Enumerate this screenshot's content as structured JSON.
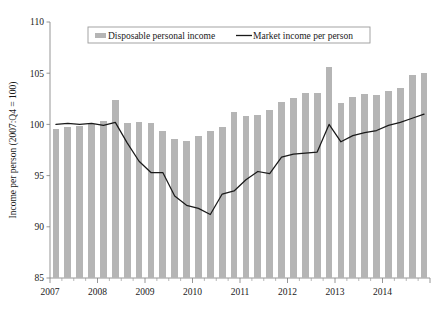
{
  "chart_data": {
    "type": "bar",
    "title": "",
    "xlabel": "",
    "ylabel": "Income per person (2007:Q4 = 100)",
    "ylim": [
      85,
      110
    ],
    "yticks": [
      85,
      90,
      95,
      100,
      105,
      110
    ],
    "ytick_labels": [
      "85",
      "90",
      "95",
      "100",
      "105",
      "110"
    ],
    "xlim_labels": [
      "2007",
      "2008",
      "2009",
      "2010",
      "2011",
      "2012",
      "2013",
      "2014"
    ],
    "x_tick_years": [
      "2007",
      "2008",
      "2009",
      "2010",
      "2011",
      "2012",
      "2013",
      "2014"
    ],
    "grid": false,
    "legend_position": "top-center",
    "x": [
      "2007:Q1",
      "2007:Q2",
      "2007:Q3",
      "2007:Q4",
      "2008:Q1",
      "2008:Q2",
      "2008:Q3",
      "2008:Q4",
      "2009:Q1",
      "2009:Q2",
      "2009:Q3",
      "2009:Q4",
      "2010:Q1",
      "2010:Q2",
      "2010:Q3",
      "2010:Q4",
      "2011:Q1",
      "2011:Q2",
      "2011:Q3",
      "2011:Q4",
      "2012:Q1",
      "2012:Q2",
      "2012:Q3",
      "2012:Q4",
      "2013:Q1",
      "2013:Q2",
      "2013:Q3",
      "2013:Q4",
      "2014:Q1",
      "2014:Q2",
      "2014:Q3",
      "2014:Q4"
    ],
    "series": [
      {
        "name": "Disposable personal income",
        "kind": "bar",
        "color": "#b5b5b5",
        "values": [
          99.6,
          99.7,
          99.8,
          100.0,
          100.3,
          102.4,
          100.1,
          100.2,
          100.1,
          99.4,
          98.6,
          98.4,
          98.9,
          99.4,
          99.7,
          101.2,
          100.8,
          100.9,
          101.4,
          102.2,
          102.6,
          103.1,
          103.1,
          105.6,
          102.1,
          102.7,
          103.0,
          102.9,
          103.3,
          103.6,
          104.8,
          105.0
        ]
      },
      {
        "name": "Market income per person",
        "kind": "line",
        "color": "#1a1a1a",
        "values": [
          100.0,
          100.1,
          100.0,
          100.1,
          99.9,
          100.2,
          98.2,
          96.4,
          95.3,
          95.3,
          93.0,
          92.1,
          91.8,
          91.2,
          93.2,
          93.5,
          94.6,
          95.4,
          95.2,
          96.8,
          97.1,
          97.2,
          97.3,
          100.0,
          98.3,
          98.9,
          99.2,
          99.4,
          99.9,
          100.2,
          100.6,
          101.0
        ]
      }
    ]
  },
  "legend": {
    "bar_entry_label": "Disposable personal income",
    "line_entry_label": "Market income per person"
  },
  "axes": {
    "y_axis_title": "Income per person (2007:Q4 = 100)"
  },
  "figure": {
    "title": ""
  },
  "colors": {
    "bar_fill": "#b5b5b5",
    "line_stroke": "#1a1a1a",
    "axis": "#8a8a8a",
    "background": "#ffffff"
  }
}
